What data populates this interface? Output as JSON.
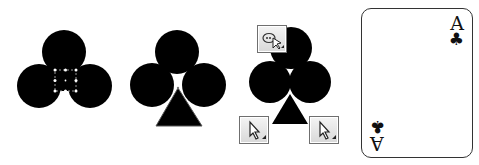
{
  "figure": {
    "steps": [
      {
        "id": "step1",
        "description": "Three overlapping circles with a selected small square (selection handles)"
      },
      {
        "id": "step2",
        "description": "Three circles with a triangle stem added"
      },
      {
        "id": "step3",
        "description": "Combined club shape with tool cursor icons"
      },
      {
        "id": "step4",
        "description": "Finished Ace of Clubs playing card"
      }
    ],
    "card": {
      "rank": "A",
      "suit_symbol": "♣"
    },
    "colors": {
      "shape_fill": "#000000",
      "background": "#ffffff",
      "card_border": "#333333",
      "handle": "#ffffff"
    }
  }
}
